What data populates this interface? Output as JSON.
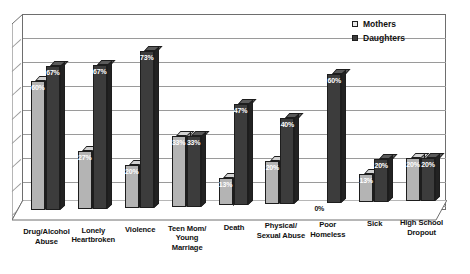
{
  "chart_data": {
    "type": "bar",
    "title": "",
    "xlabel": "",
    "ylabel": "",
    "ylim": [
      0,
      80
    ],
    "grid": true,
    "legend_position": "top-right",
    "categories": [
      "Drug/Alcohol Abuse",
      "Lonely Heartbroken",
      "Violence",
      "Teen Mom/ Young Marriage",
      "Death",
      "Physical/ Sexual Abuse",
      "Poor Homeless",
      "Sick",
      "High School Dropout"
    ],
    "category_lines": [
      [
        "Drug/Alcohol",
        "Abuse"
      ],
      [
        "Lonely",
        "Heartbroken"
      ],
      [
        "Violence"
      ],
      [
        "Teen Mom/",
        "Young",
        "Marriage"
      ],
      [
        "Death"
      ],
      [
        "Physical/",
        "Sexual Abuse"
      ],
      [
        "Poor",
        "Homeless"
      ],
      [
        "Sick"
      ],
      [
        "High School",
        "Dropout"
      ]
    ],
    "series": [
      {
        "name": "Mothers",
        "color": "#b4b4b4",
        "values": [
          60,
          27,
          20,
          33,
          13,
          20,
          0,
          13,
          20
        ],
        "labels": [
          "60%",
          "27%",
          "20%",
          "33%",
          "13%",
          "20%",
          "0%",
          "13%",
          "20%"
        ]
      },
      {
        "name": "Daughters",
        "color": "#3c3c3c",
        "values": [
          67,
          67,
          73,
          33,
          47,
          40,
          60,
          20,
          20
        ],
        "labels": [
          "67%",
          "67%",
          "73%",
          "33%",
          "47%",
          "40%",
          "60%",
          "20%",
          "20%"
        ]
      }
    ]
  },
  "legend": {
    "items": [
      {
        "label": "Mothers",
        "swatch": "light-square-icon"
      },
      {
        "label": "Daughters",
        "swatch": "dark-square-icon"
      }
    ]
  }
}
